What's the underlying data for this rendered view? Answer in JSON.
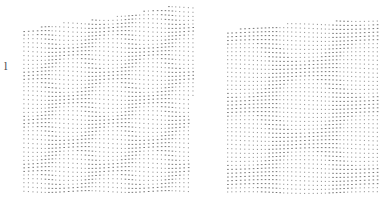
{
  "figure": {
    "panel_label": "l",
    "dot_color": "#6f6f6f",
    "background": "#ffffff",
    "panels": [
      {
        "name": "left-lattice",
        "description": "Twisted bilayer dot lattice showing hexagonal moiré pattern (smaller cells)",
        "corners": [
          [
            24,
            29
          ],
          [
            194,
            3
          ],
          [
            190,
            192
          ],
          [
            24,
            193
          ]
        ],
        "spacing": 4.0,
        "twist_deg": 6.0,
        "moire_cell_px": 40
      },
      {
        "name": "right-lattice",
        "description": "Twisted bilayer dot lattice showing relaxed hexagonal moiré pattern (larger cells)",
        "corners": [
          [
            228,
            29
          ],
          [
            379,
            16
          ],
          [
            379,
            193
          ],
          [
            228,
            193
          ]
        ],
        "spacing": 4.0,
        "twist_deg": 4.0,
        "moire_cell_px": 62
      }
    ]
  }
}
